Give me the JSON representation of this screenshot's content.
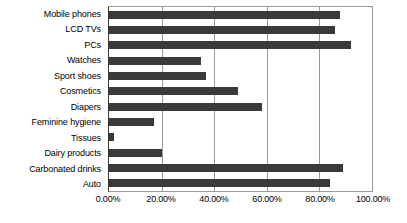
{
  "chart_data": {
    "type": "bar",
    "orientation": "horizontal",
    "title": "",
    "xlabel": "",
    "ylabel": "",
    "xlim": [
      0,
      100
    ],
    "grid": true,
    "legend": false,
    "bar_color": "#3a3a3a",
    "categories": [
      "Mobile phones",
      "LCD TVs",
      "PCs",
      "Watches",
      "Sport shoes",
      "Cosmetics",
      "Diapers",
      "Feminine hygiene",
      "Tissues",
      "Dairy products",
      "Carbonated drinks",
      "Auto"
    ],
    "values": [
      88,
      86,
      92,
      35,
      37,
      49,
      58,
      17,
      2,
      20,
      89,
      84
    ],
    "tick_labels": [
      "0.00%",
      "20.00%",
      "40.00%",
      "60.00%",
      "80.00%",
      "100.00%"
    ],
    "tick_values": [
      0,
      20,
      40,
      60,
      80,
      100
    ]
  }
}
